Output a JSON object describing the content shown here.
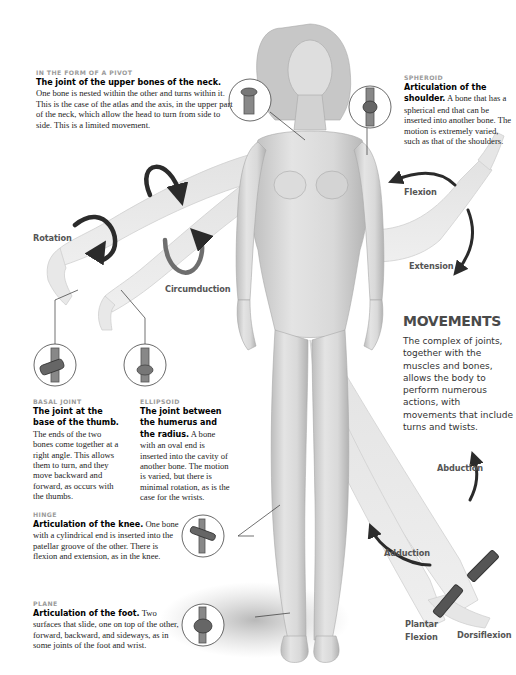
{
  "colors": {
    "kicker": "#9b9b9b",
    "heading": "#4a4a4a",
    "arrow": "#2b2b2b",
    "figure": "#d6d6d6"
  },
  "joints": [
    {
      "id": "pivot",
      "kicker": "IN THE FORM OF A PIVOT",
      "heading": "The joint of the upper bones of the neck.",
      "body": "One bone is nested within the other and turns within it. This is the case of the atlas and the axis, in the upper part of the neck, which allow the head to turn from side to side. This is a limited movement.",
      "icon": "pivot-joint-icon"
    },
    {
      "id": "spheroid",
      "kicker": "SPHEROID",
      "heading": "Articulation of the shoulder.",
      "body": "A bone that has a spherical end that can be inserted into another bone. The motion is extremely varied, such as that of the shoulders.",
      "icon": "spheroid-joint-icon"
    },
    {
      "id": "basal",
      "kicker": "BASAL JOINT",
      "heading": "The joint at the base of the thumb.",
      "body": "The ends of the two bones come together at a right angle. This allows them to turn, and they move backward and forward, as occurs with the thumbs.",
      "icon": "saddle-joint-icon"
    },
    {
      "id": "ellipsoid",
      "kicker": "ELLIPSOID",
      "heading": "The joint between the humerus and the radius.",
      "body": "A bone with an oval end is inserted into the cavity of another bone. The motion is varied, but there is minimal rotation, as is the case for the wrists.",
      "icon": "ellipsoid-joint-icon"
    },
    {
      "id": "hinge",
      "kicker": "HINGE",
      "heading": "Articulation of the knee.",
      "body": "One bone with a cylindrical end is inserted into the patellar groove of the other. There is flexion and extension, as in the knee.",
      "icon": "hinge-joint-icon"
    },
    {
      "id": "plane",
      "kicker": "PLANE",
      "heading": "Articulation of the foot.",
      "body": "Two surfaces that slide, one on top of the other, forward, backward, and sideways, as in some joints of the foot and wrist.",
      "icon": "plane-joint-icon"
    }
  ],
  "movements": {
    "title": "MOVEMENTS",
    "intro": "The complex of joints, together with the muscles and bones, allows the body to perform numerous actions, with movements that include turns and twists.",
    "labels": {
      "rotation": "Rotation",
      "circumduction": "Circumduction",
      "flexion": "Flexion",
      "extension": "Extension",
      "abduction": "Abduction",
      "adduction": "Adduction",
      "plantar_flexion_1": "Plantar",
      "plantar_flexion_2": "Flexion",
      "dorsiflexion": "Dorsiflexion"
    }
  }
}
